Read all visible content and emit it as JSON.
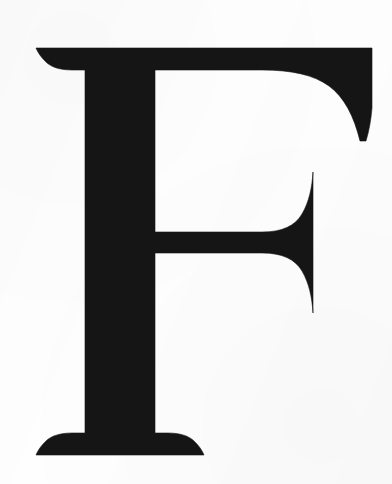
{
  "image": {
    "kind": "scanned-letterform",
    "subject": "letter-F",
    "character": "F",
    "script": "latin",
    "case": "uppercase",
    "typeface_style": "serif",
    "width_px": 392,
    "height_px": 484,
    "background_color": "#fefefe",
    "ink_color": "#151515",
    "alt_text": "Large black uppercase serif letter F on a white background"
  },
  "glyph": {
    "label": "F",
    "metrics": {
      "cap_line_y": 48,
      "baseline_y": 455,
      "stem_left_x": 85,
      "stem_right_x": 155,
      "top_bar_bottom_y": 77,
      "top_bar_right_x": 372,
      "top_arm_terminal_bottom_y": 141,
      "mid_bar_top_y": 232,
      "mid_bar_bottom_y": 253,
      "mid_arm_right_x": 313,
      "mid_serif_top_y": 172,
      "mid_serif_bottom_y": 313,
      "foot_serif_left_x": 36,
      "foot_serif_right_x": 204
    },
    "features": [
      "bracketed top-left serif",
      "tapered concave top-right arm terminal",
      "vertical slab serif on middle arm",
      "splayed bracketed foot serif"
    ],
    "outline_path": "M 36 48 L 372 48 L 372 108 C 371 120 369 131 366 141 L 360 141 C 354 116 344 97 329 86 C 314 75 292 70 262 70 L 155 70 L 155 232 L 262 232 C 282 232 295 226 302 214 C 309 202 312 188 313 172 L 313 313 C 312 297 309 283 302 271 C 295 259 282 253 262 253 L 155 253 L 155 433 L 168 433 C 180 433 189 436 194 441 C 199 446 202 450 204 455 L 36 455 C 38 450 41 446 46 441 C 51 436 60 433 72 433 L 85 433 L 85 70 L 72 70 C 60 70 51 67 46 62 C 41 57 38 53 36 48 Z"
  }
}
